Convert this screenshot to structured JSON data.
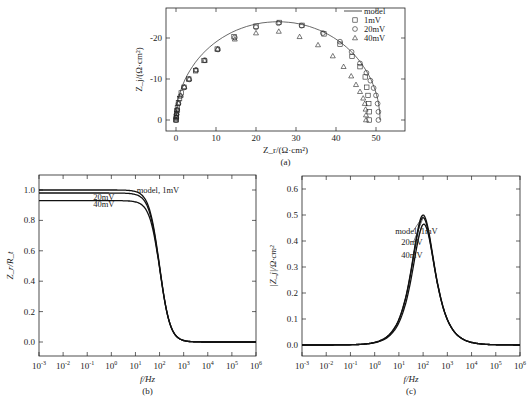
{
  "figure": {
    "panels": [
      "(a)",
      "(b)",
      "(c)"
    ]
  },
  "chart_data": [
    {
      "id": "a",
      "type": "scatter",
      "title": "",
      "caption": "(a)",
      "xlabel": "Z_r/(Ω·cm²)",
      "ylabel": "Z_j/(Ω·cm²)",
      "xlim": [
        -2,
        57
      ],
      "ylim": [
        2.5,
        -27
      ],
      "xticks": [
        0,
        10,
        20,
        30,
        40,
        50
      ],
      "yticks": [
        0,
        -10,
        -20
      ],
      "grid": false,
      "legend_position": "upper right",
      "legend": [
        {
          "label": "model",
          "marker": "line"
        },
        {
          "label": "1mV",
          "marker": "square"
        },
        {
          "label": "20mV",
          "marker": "circle"
        },
        {
          "label": "40mV",
          "marker": "triangle"
        }
      ],
      "series": [
        {
          "name": "model",
          "kind": "line",
          "center": 25.5,
          "radius": 25.5
        },
        {
          "name": "1mV",
          "kind": "square",
          "center": 25.5,
          "radius": 25.5,
          "points": [
            [
              0,
              0
            ],
            [
              0.05,
              -0.5
            ],
            [
              0.1,
              -1
            ],
            [
              0.15,
              -1.6
            ],
            [
              0.25,
              -2.3
            ],
            [
              0.35,
              -3
            ],
            [
              0.6,
              -4.2
            ],
            [
              0.9,
              -5.2
            ],
            [
              1.3,
              -6.6
            ],
            [
              2,
              -8
            ],
            [
              3.2,
              -10
            ],
            [
              4.9,
              -12
            ],
            [
              7,
              -14.5
            ],
            [
              10.3,
              -17.3
            ],
            [
              14.5,
              -20.3
            ],
            [
              20,
              -22.9
            ],
            [
              25.8,
              -23.8
            ],
            [
              31.5,
              -23.1
            ],
            [
              37,
              -21
            ],
            [
              41,
              -18.5
            ],
            [
              44,
              -15.5
            ],
            [
              46,
              -13
            ],
            [
              47.3,
              -10.5
            ],
            [
              47.7,
              -8
            ],
            [
              48.0,
              -6
            ],
            [
              48.2,
              -4
            ],
            [
              48.3,
              -2
            ],
            [
              48.3,
              0
            ]
          ]
        },
        {
          "name": "20mV",
          "kind": "circle",
          "center": 25.3,
          "radius": 25.3,
          "points": [
            [
              0,
              0
            ],
            [
              0.05,
              -0.6
            ],
            [
              0.12,
              -1.3
            ],
            [
              0.3,
              -2.5
            ],
            [
              0.6,
              -4
            ],
            [
              1.1,
              -5.8
            ],
            [
              2,
              -7.9
            ],
            [
              3.3,
              -9.9
            ],
            [
              5,
              -12.2
            ],
            [
              7.2,
              -14.6
            ],
            [
              10.5,
              -17.2
            ],
            [
              14.7,
              -20.1
            ],
            [
              20,
              -22.6
            ],
            [
              25.6,
              -23.6
            ],
            [
              31.4,
              -23
            ],
            [
              36.7,
              -21.2
            ],
            [
              41,
              -19.1
            ],
            [
              43.9,
              -16.6
            ],
            [
              46,
              -13.8
            ],
            [
              47.6,
              -11.5
            ],
            [
              48.6,
              -9.6
            ],
            [
              49.4,
              -7.8
            ],
            [
              50,
              -6
            ],
            [
              50.4,
              -4
            ],
            [
              50.6,
              -2
            ],
            [
              50.6,
              0
            ]
          ]
        },
        {
          "name": "40mV",
          "kind": "triangle",
          "points": [
            [
              0,
              0
            ],
            [
              0.05,
              -0.8
            ],
            [
              0.15,
              -1.7
            ],
            [
              0.3,
              -2.6
            ],
            [
              0.6,
              -4.1
            ],
            [
              1.2,
              -6
            ],
            [
              2.1,
              -8.1
            ],
            [
              3.3,
              -10
            ],
            [
              5,
              -12.2
            ],
            [
              7.2,
              -14.5
            ],
            [
              10.4,
              -17.3
            ],
            [
              14.7,
              -19.7
            ],
            [
              20,
              -21.2
            ],
            [
              25.7,
              -21.6
            ],
            [
              30.9,
              -20.3
            ],
            [
              35.5,
              -18.3
            ],
            [
              39.2,
              -15.6
            ],
            [
              41.9,
              -13
            ],
            [
              43.8,
              -10.7
            ],
            [
              45,
              -8.6
            ],
            [
              46,
              -6.9
            ],
            [
              46.8,
              -5.3
            ],
            [
              47.2,
              -4
            ],
            [
              47.4,
              -2.6
            ],
            [
              47.5,
              -1.2
            ],
            [
              47.5,
              0
            ]
          ]
        }
      ]
    },
    {
      "id": "b",
      "type": "line",
      "title": "",
      "caption": "(b)",
      "xlabel": "f/Hz",
      "ylabel": "Z_r/R_t",
      "xscale": "log",
      "xlim_exp": [
        -3,
        6
      ],
      "xticks": [
        "10^-3",
        "10^-2",
        "10^-1",
        "10^0",
        "10^1",
        "10^2",
        "10^3",
        "10^4",
        "10^5",
        "10^6"
      ],
      "ylim": [
        -0.1,
        1.1
      ],
      "yticks": [
        "0.0",
        "0.2",
        "0.4",
        "0.6",
        "0.8",
        "1.0"
      ],
      "grid": false,
      "annotations": [
        {
          "text": "model, 1mV",
          "x_exp": 1.05,
          "y": 1.0
        },
        {
          "text": "20mV",
          "x_exp": -0.75,
          "y": 0.955
        },
        {
          "text": "40mV",
          "x_exp": -0.75,
          "y": 0.91
        }
      ],
      "series": [
        {
          "name": "model, 1mV",
          "plateau": 1.0,
          "fc_exp": 2.0
        },
        {
          "name": "20mV",
          "plateau": 0.98,
          "fc_exp": 2.0
        },
        {
          "name": "40mV",
          "plateau": 0.93,
          "fc_exp": 2.02
        }
      ]
    },
    {
      "id": "c",
      "type": "line",
      "title": "",
      "caption": "(c)",
      "xlabel": "f/Hz",
      "ylabel": "|Z_j|/Ω·cm²",
      "xscale": "log",
      "xlim_exp": [
        -3,
        6
      ],
      "xticks": [
        "10^-3",
        "10^-2",
        "10^-1",
        "10^0",
        "10^1",
        "10^2",
        "10^3",
        "10^4",
        "10^5",
        "10^6"
      ],
      "ylim": [
        -0.05,
        0.65
      ],
      "yticks": [
        "0.0",
        "0.1",
        "0.2",
        "0.3",
        "0.4",
        "0.5",
        "0.6"
      ],
      "grid": false,
      "annotations": [
        {
          "text": "model, 1mV",
          "x_exp": 0.85,
          "y": 0.44
        },
        {
          "text": "20mV",
          "x_exp": 1.1,
          "y": 0.395
        },
        {
          "text": "40mV",
          "x_exp": 1.1,
          "y": 0.345
        }
      ],
      "series": [
        {
          "name": "model, 1mV",
          "peak": 0.5,
          "fc_exp": 2.0
        },
        {
          "name": "20mV",
          "peak": 0.49,
          "fc_exp": 2.0
        },
        {
          "name": "40mV",
          "peak": 0.465,
          "fc_exp": 2.03
        }
      ]
    }
  ]
}
